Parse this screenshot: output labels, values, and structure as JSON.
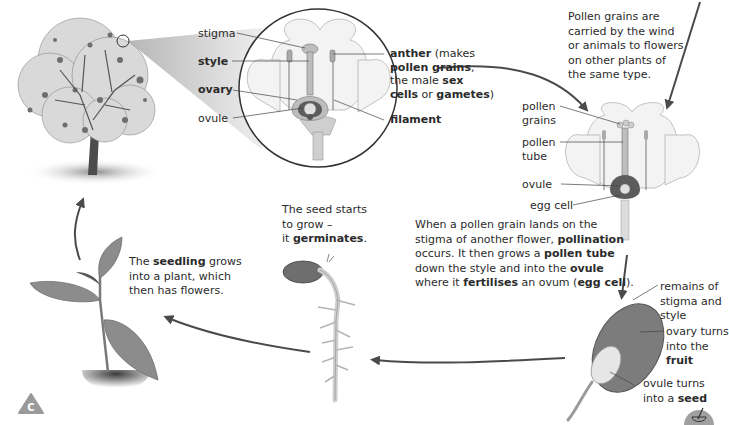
{
  "diagram": {
    "flower_labels": {
      "stigma": "stigma",
      "style": "style",
      "ovary": "ovary",
      "ovule": "ovule",
      "anther_bold": "anther",
      "anther_rest": " (makes",
      "pollen_grains_bold": "pollen grains",
      "comma": ",",
      "the_male": "the male ",
      "sex_bold": "sex",
      "cells_bold": "cells",
      "or": " or ",
      "gametes_bold": "gametes",
      "close_paren": ")",
      "filament": "filament"
    },
    "pollination_caption": {
      "line1": "Pollen grains are",
      "line2": "carried by the wind",
      "line3": "or animals to flowers",
      "line4": "on other plants of",
      "line5": "the same type."
    },
    "pollinated_flower_labels": {
      "pollen_grains_1": "pollen",
      "pollen_grains_2": "grains",
      "pollen_tube_1": "pollen",
      "pollen_tube_2": "tube",
      "ovule": "ovule",
      "egg_cell": "egg cell"
    },
    "fertilisation_caption": {
      "l1": "When a pollen grain lands on the",
      "l2a": "stigma of another flower, ",
      "l2b": "pollination",
      "l3a": "occurs. It then grows a ",
      "l3b": "pollen tube",
      "l4a": "down  the style and into the ",
      "l4b": "ovule",
      "l5a": "where it ",
      "l5b": "fertilises",
      "l5c": " an ovum (",
      "l5d": "egg cell",
      "l5e": ")."
    },
    "fruit_labels": {
      "remains_1": "remains of",
      "remains_2": "stigma and",
      "remains_3": "style",
      "ovary_1": "ovary turns",
      "ovary_2": "into the",
      "ovary_3": "fruit",
      "ovule_1": "ovule turns",
      "ovule_2a": "into a ",
      "ovule_2b": "seed"
    },
    "germination_caption": {
      "l1": "The seed starts",
      "l2": "to grow –",
      "l3a": "it ",
      "l3b": "germinates",
      "l3c": "."
    },
    "seedling_caption": {
      "l1a": "The ",
      "l1b": "seedling",
      "l1c": " grows",
      "l2": "into a plant, which",
      "l3": "then has flowers."
    },
    "badges": {
      "bottom_left": "C"
    }
  },
  "colors": {
    "arrow": "#4a4a4a",
    "text": "#2b2b2b",
    "leaf": "#8a8a8a",
    "petal": "#f2f2f2",
    "ovary": "#666666",
    "badge": "#9a9a9a"
  }
}
